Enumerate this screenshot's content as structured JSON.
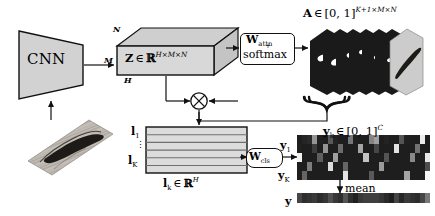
{
  "figure": {
    "type": "architecture-diagram"
  },
  "cnn": {
    "label": "CNN"
  },
  "input_image": {
    "name": "input-histology-patch"
  },
  "feature_tensor": {
    "symbol": "Z",
    "membership": "∈",
    "space": "ℝ",
    "superscript": "H×M×N",
    "dim_top": "N",
    "dim_left": "M",
    "dim_bottom": "H"
  },
  "attention_block": {
    "line1_main": "W",
    "line1_sub": "attn",
    "plus": "+",
    "line2": "softmax"
  },
  "attention_tensor": {
    "symbol": "A",
    "membership": "∈",
    "range": "[0, 1]",
    "superscript": "K+1×M×N",
    "num_maps": 6
  },
  "multiply_node": {
    "glyph": "⊗"
  },
  "local_features": {
    "first": "l",
    "first_sub": "1",
    "dots": "⋮",
    "last": "l",
    "last_sub": "K",
    "caption_symbol": "l",
    "caption_sub": "k",
    "caption_membership": "∈",
    "caption_space": "ℝ",
    "caption_sup": "H",
    "rows": 6
  },
  "classifier_block": {
    "main": "W",
    "sub": "cls"
  },
  "logits": {
    "symbol": "y",
    "sub": "k",
    "membership": "∈",
    "range": "[0, 1]",
    "superscript": "C",
    "row_first": "y",
    "row_first_sub": "1",
    "row_last": "y",
    "row_last_sub": "K",
    "rows": 5,
    "cols": 26
  },
  "mean_op": {
    "label": "mean"
  },
  "output": {
    "symbol": "y",
    "cols": 26
  },
  "colors": {
    "stroke": "#111111",
    "box_fill": "#d2d2d2",
    "attention_dark": "#1a1a1a",
    "attention_light": "#c9c9c9",
    "heatmap_bg": "#141414",
    "page_bg": "#ffffff"
  },
  "chart_data": {
    "type": "heatmap",
    "rows": 5,
    "cols": 26,
    "values": [
      [
        0.05,
        0.08,
        0.1,
        0.55,
        0.06,
        0.05,
        0.3,
        0.07,
        0.05,
        0.05,
        0.42,
        0.06,
        0.05,
        0.05,
        0.48,
        0.6,
        0.05,
        0.07,
        0.05,
        0.05,
        0.28,
        0.06,
        0.05,
        0.05,
        0.92,
        0.05
      ],
      [
        0.06,
        0.05,
        0.05,
        0.18,
        0.05,
        0.55,
        0.05,
        0.05,
        0.38,
        0.05,
        0.05,
        0.05,
        0.62,
        0.05,
        0.05,
        0.22,
        0.05,
        0.05,
        0.05,
        0.88,
        0.05,
        0.05,
        0.05,
        0.4,
        0.05,
        0.05
      ],
      [
        0.95,
        0.05,
        0.05,
        0.05,
        0.32,
        0.05,
        0.05,
        0.6,
        0.05,
        0.05,
        0.05,
        0.05,
        0.05,
        0.75,
        0.05,
        0.05,
        0.05,
        0.28,
        0.05,
        0.05,
        0.05,
        0.05,
        0.5,
        0.05,
        0.05,
        0.9
      ],
      [
        0.05,
        0.05,
        0.45,
        0.05,
        0.05,
        0.05,
        0.85,
        0.05,
        0.05,
        0.35,
        0.05,
        0.05,
        0.05,
        0.05,
        0.05,
        0.05,
        0.58,
        0.05,
        0.05,
        0.05,
        0.05,
        0.05,
        0.05,
        0.05,
        0.05,
        0.25
      ],
      [
        0.05,
        0.35,
        0.05,
        0.05,
        0.05,
        0.05,
        0.05,
        0.05,
        0.05,
        0.88,
        0.05,
        0.05,
        0.05,
        0.05,
        0.3,
        0.05,
        0.05,
        0.05,
        0.05,
        0.05,
        0.05,
        0.62,
        0.05,
        0.05,
        0.05,
        0.96
      ]
    ],
    "mean_values": [
      0.22,
      0.12,
      0.14,
      0.17,
      0.11,
      0.15,
      0.26,
      0.16,
      0.12,
      0.28,
      0.12,
      0.06,
      0.16,
      0.19,
      0.19,
      0.19,
      0.15,
      0.1,
      0.05,
      0.21,
      0.09,
      0.17,
      0.13,
      0.11,
      0.22,
      0.43
    ]
  }
}
